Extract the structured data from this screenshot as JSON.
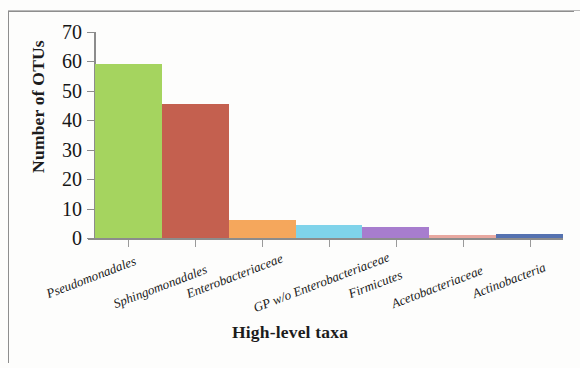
{
  "chart_data": {
    "type": "bar",
    "title": "",
    "xlabel": "High-level taxa",
    "ylabel": "Number of OTUs",
    "categories": [
      "Pseudomonadales",
      "Sphingomonadales",
      "Enterobacteriaceae",
      "GP w/o Enterobacteriaceae",
      "Firmicutes",
      "Acetobacteriaceae",
      "Actinobacteria"
    ],
    "values": [
      59,
      45.5,
      6,
      4.5,
      3.7,
      1,
      1.5
    ],
    "colors": [
      "#a5d45f",
      "#c4604f",
      "#f5a75c",
      "#7fd3ea",
      "#a77dce",
      "#e8a8a0",
      "#5572b0"
    ],
    "ylim": [
      0,
      70
    ],
    "ytick_values": [
      0,
      10,
      20,
      30,
      40,
      50,
      60,
      70
    ],
    "ytick_labels": [
      "0",
      "10",
      "20",
      "30",
      "40",
      "50",
      "60",
      "70"
    ],
    "grid": false,
    "legend": false,
    "legend_position": "none",
    "bar_gap": 0,
    "axis_color": "#8c8c8c"
  }
}
